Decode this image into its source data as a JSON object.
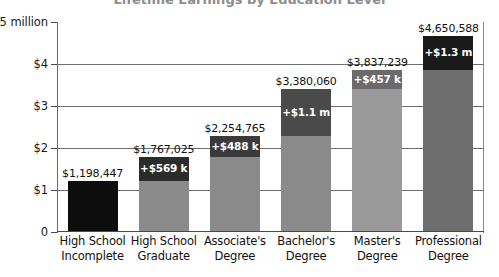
{
  "chart_data": {
    "type": "bar",
    "subtype": "stacked-increment-bar",
    "title": "Lifetime Earnings by Education Level",
    "xlabel": "",
    "ylabel": "",
    "ylim": [
      0,
      5000000
    ],
    "grid": true,
    "legend": "none",
    "y_ticks": [
      {
        "value": 0,
        "label": "0"
      },
      {
        "value": 1000000,
        "label": "$1"
      },
      {
        "value": 2000000,
        "label": "$2"
      },
      {
        "value": 3000000,
        "label": "$3"
      },
      {
        "value": 4000000,
        "label": "$4"
      },
      {
        "value": 5000000,
        "label": "$5 million"
      }
    ],
    "categories": [
      "High School Incomplete",
      "High School Graduate",
      "Associate's Degree",
      "Bachelor's Degree",
      "Master's Degree",
      "Professional Degree"
    ],
    "category_lines": [
      [
        "High School",
        "Incomplete"
      ],
      [
        "High School",
        "Graduate"
      ],
      [
        "Associate's",
        "Degree"
      ],
      [
        "Bachelor's",
        "Degree"
      ],
      [
        "Master's",
        "Degree"
      ],
      [
        "Professional",
        "Degree"
      ]
    ],
    "values": [
      1198447,
      1767025,
      2254765,
      3380060,
      3837239,
      4650588
    ],
    "total_labels": [
      "$1,198,447",
      "$1,767,025",
      "$2,254,765",
      "$3,380,060",
      "$3,837,239",
      "$4,650,588"
    ],
    "increments": [
      0,
      568578,
      487740,
      1125295,
      457179,
      813349
    ],
    "increment_labels": [
      "",
      "+$569 k",
      "+$488 k",
      "+$1.1 m",
      "+$457 k",
      "+$1.3 m"
    ],
    "bases": [
      1198447,
      1198447,
      1767025,
      2254765,
      3380060,
      3837239
    ],
    "colors": {
      "bar_base": [
        "#0d0d0d",
        "#8a8a8a",
        "#8a8a8a",
        "#8a8a8a",
        "#9a9a9a",
        "#6e6e6e"
      ],
      "bar_cap": [
        "#0d0d0d",
        "#2b2b2b",
        "#3a3a3a",
        "#4a4a4a",
        "#6a6a6a",
        "#1a1a1a"
      ],
      "gridline": "#6e6e6e",
      "axis": "#4a4a4a",
      "text": "#111111",
      "cap_text": "#ffffff",
      "background": "#ffffff"
    }
  }
}
